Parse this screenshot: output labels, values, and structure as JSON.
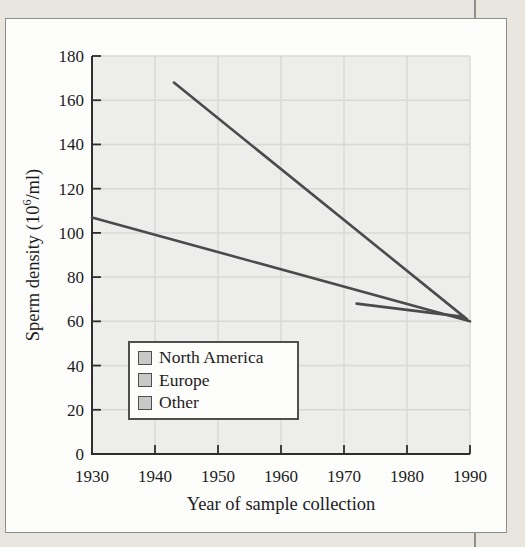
{
  "figure": {
    "type_note": "grayscale textbook line chart"
  },
  "chart_data": {
    "type": "line",
    "title": "",
    "xlabel": "Year of sample collection",
    "ylabel": "Sperm density (10⁶/ml)",
    "ylabel_prefix": "Sperm density (10",
    "ylabel_sup": "6",
    "ylabel_suffix": "/ml)",
    "xlim": [
      1930,
      1990
    ],
    "ylim": [
      0,
      180
    ],
    "x_ticks": [
      1930,
      1940,
      1950,
      1960,
      1970,
      1980,
      1990
    ],
    "y_ticks": [
      0,
      20,
      40,
      60,
      80,
      100,
      120,
      140,
      160,
      180
    ],
    "grid": true,
    "legend_position": "lower-left-inside",
    "series": [
      {
        "name": "North America",
        "points": [
          [
            1930,
            107
          ],
          [
            1990,
            60
          ]
        ]
      },
      {
        "name": "Europe",
        "points": [
          [
            1943,
            168
          ],
          [
            1989.5,
            61
          ]
        ]
      },
      {
        "name": "Other",
        "points": [
          [
            1972,
            68
          ],
          [
            1989,
            62
          ]
        ]
      }
    ],
    "colors": {
      "line": "#4b4b4e",
      "plot_bg": "#ededeb",
      "grid": "#d8d8d4",
      "axis": "#2e2e2e",
      "tick_text": "#1c1c1c",
      "legend_swatch": "#c8c8c6",
      "page_bg": "#e9e6df",
      "card_border": "#8d8d8d"
    }
  }
}
